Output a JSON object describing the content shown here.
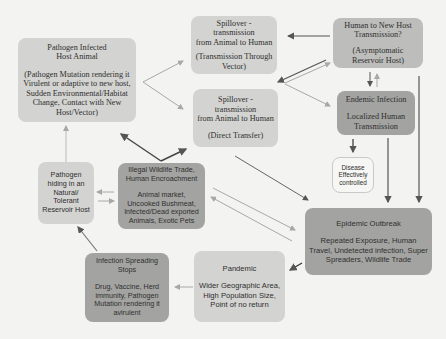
{
  "nodes": {
    "host_animal": {
      "title_1": "Pathogen Infected",
      "title_2": "Host Animal",
      "detail": "(Pathogen Mutation rendering it Virulent or adaptive to new host, Sudden Environmental/Habitat Change, Contact with New Host/Vector)"
    },
    "spill_vector": {
      "title_1": "Spillover - transmission",
      "title_2": "from Animal to Human",
      "detail": "(Transmission Through Vector)"
    },
    "spill_direct": {
      "title_1": "Spillover - transmission",
      "title_2": "from Animal to Human",
      "detail": "(Direct Transfer)"
    },
    "human_new_host": {
      "title_1": "Human to New Host",
      "title_2": "Transmission?",
      "detail": "(Asymptomatic Reservoir Host)"
    },
    "endemic": {
      "title": "Endemic Infection",
      "detail": "Localized Human Transmission"
    },
    "controlled": {
      "text": "Disease Effectively controlled"
    },
    "reservoir": {
      "text": "Pathogen hiding in an Natural/ Tolerant Reservoir Host"
    },
    "wildlife_trade": {
      "title": "Illegal Wildlife Trade, Human Encroachment",
      "detail": "Animal market, Uncooked Bushmeat, Infected/Dead exported Animals, Exotic Pets"
    },
    "epidemic": {
      "title": "Epidemic Outbreak",
      "detail": "Repeated Exposure, Human Travel, Undetected infection, Super Spreaders, Wildlife Trade"
    },
    "pandemic": {
      "title": "Pandemic",
      "detail": "Wider Geographic Area, High Population Size, Point of no return"
    },
    "stops": {
      "title": "Infection Spreading Stops",
      "detail": "Drug, Vaccine, Herd immunity, Pathogen Mutation rendering it avirulent"
    }
  },
  "colors": {
    "background": "#f3f3f1",
    "light_box": "#d3d3d1",
    "mid_box": "#bdbdbb",
    "dark_box": "#a3a3a1",
    "arrow_dark": "#555555",
    "arrow_light": "#a8a8a8"
  }
}
